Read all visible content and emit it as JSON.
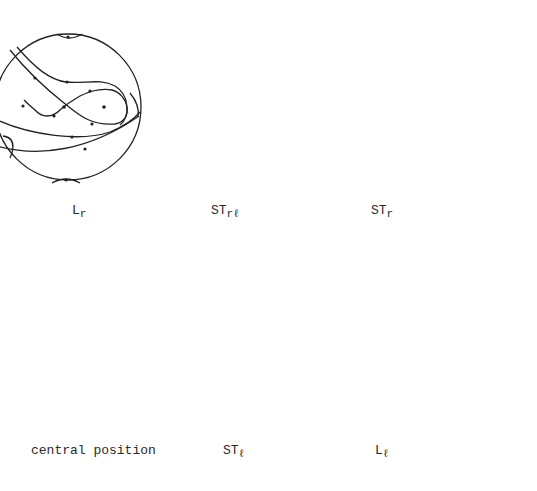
{
  "figure": {
    "ink_color": "#222222",
    "background": "#ffffff"
  },
  "panels": [
    {
      "id": "Lr",
      "label_main": "L",
      "label_sub": "r",
      "position": "top-left",
      "features": [
        "saddle figure-eight",
        "centre (dot) inside right loop",
        "trajectories with arrows"
      ]
    },
    {
      "id": "STrl",
      "label_main": "ST",
      "label_sub": "rℓ",
      "position": "top-middle",
      "features": [
        "saddle figure-eight",
        "spiral focus on right",
        "trajectories with arrows"
      ]
    },
    {
      "id": "STr",
      "label_main": "ST",
      "label_sub": "r",
      "position": "top-right",
      "features": [
        "saddle",
        "spiral focus on right",
        "trajectories with arrows"
      ]
    },
    {
      "id": "central",
      "label_main": "central position",
      "label_sub": "",
      "position": "bottom-left",
      "features": [
        "saddle crossing",
        "trajectories with arrows"
      ]
    },
    {
      "id": "STl",
      "label_main": "ST",
      "label_sub": "ℓ",
      "position": "bottom-middle",
      "features": [
        "saddle figure-eight",
        "spiral focus on left",
        "trajectories with arrows"
      ]
    },
    {
      "id": "Ll",
      "label_main": "L",
      "label_sub": "ℓ",
      "position": "bottom-right",
      "features": [
        "saddle figure-eight",
        "centre (dot) inside left loop",
        "trajectories with arrows"
      ]
    }
  ]
}
